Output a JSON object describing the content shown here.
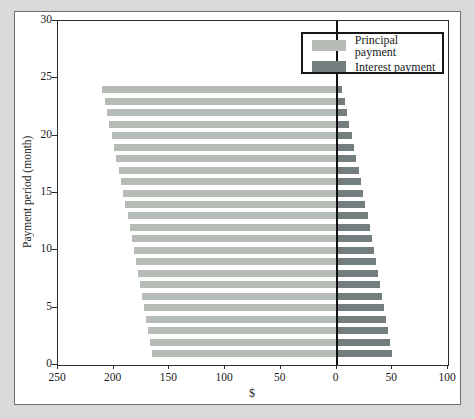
{
  "figure": {
    "background_color": "#d9dbd9",
    "plot_background": "#ffffff",
    "frame_border_color": "#6e6e6e",
    "zero_line_color": "#111111"
  },
  "legend": {
    "items": [
      {
        "label": "Principal payment",
        "color": "#b6bcb6"
      },
      {
        "label": "Interest payment",
        "color": "#747e7e"
      }
    ]
  },
  "chart_data": {
    "type": "bar",
    "orientation": "horizontal",
    "title": "",
    "xlabel": "$",
    "ylabel": "Payment period (month)",
    "x_axis": {
      "left_max": 250,
      "right_max": 100,
      "tick_values": [
        -250,
        -200,
        -150,
        -100,
        -50,
        0,
        50,
        100
      ],
      "tick_labels": [
        "250",
        "200",
        "150",
        "100",
        "50",
        "0",
        "50",
        "100"
      ]
    },
    "y_axis": {
      "min": 0,
      "max": 30,
      "ticks": [
        0,
        5,
        10,
        15,
        20,
        25,
        30
      ]
    },
    "months": [
      1,
      2,
      3,
      4,
      5,
      6,
      7,
      8,
      9,
      10,
      11,
      12,
      13,
      14,
      15,
      16,
      17,
      18,
      19,
      20,
      21,
      22,
      23,
      24
    ],
    "series": [
      {
        "name": "Principal payment",
        "direction": "left-of-zero",
        "color": "#b6bcb6",
        "values": [
          165.4,
          167.1,
          168.9,
          170.7,
          172.5,
          174.3,
          176.1,
          178.0,
          179.8,
          181.7,
          183.6,
          185.6,
          187.5,
          189.5,
          191.5,
          193.5,
          195.5,
          197.6,
          199.6,
          201.7,
          203.9,
          206.0,
          208.2,
          210.4
        ]
      },
      {
        "name": "Interest payment",
        "direction": "right-of-zero",
        "color": "#747e7e",
        "values": [
          50.0,
          48.3,
          46.5,
          44.7,
          42.9,
          41.1,
          39.3,
          37.4,
          35.6,
          33.7,
          31.8,
          29.8,
          27.9,
          25.9,
          23.9,
          21.9,
          19.9,
          17.8,
          15.8,
          13.7,
          11.5,
          9.4,
          7.2,
          5.0
        ]
      }
    ]
  }
}
